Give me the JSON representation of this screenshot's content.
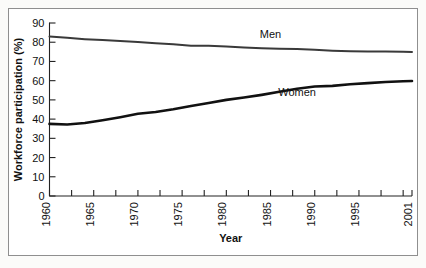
{
  "chart_data": {
    "type": "line",
    "title": "",
    "xlabel": "Year",
    "ylabel": "Workforce participation (%)",
    "xlim": [
      1960,
      2001
    ],
    "ylim": [
      0,
      90
    ],
    "ytick_values": [
      0,
      10,
      20,
      30,
      40,
      50,
      60,
      70,
      80,
      90
    ],
    "ytick_labels": [
      "0",
      "10",
      "20",
      "30",
      "40",
      "50",
      "60",
      "70",
      "80",
      "90"
    ],
    "xtick_labels": [
      "1960",
      "1965",
      "1970",
      "1975",
      "1980",
      "1985",
      "1990",
      "1995",
      "2001"
    ],
    "xtick_label_values": [
      1960,
      1965,
      1970,
      1975,
      1980,
      1985,
      1990,
      1995,
      2001
    ],
    "xtick_minor_values": [
      1962.5,
      1967.5,
      1972.5,
      1977.5,
      1982.5,
      1987.5,
      1992.5,
      1997.5,
      2000
    ],
    "grid": false,
    "legend_position": "inline-annotation",
    "series": [
      {
        "name": "Men",
        "label": "Men",
        "color": "#3a3a3a",
        "stroke_width": 2.0,
        "label_x": 1985,
        "label_y": 82,
        "x": [
          1960,
          1962,
          1964,
          1966,
          1968,
          1970,
          1972,
          1974,
          1976,
          1978,
          1980,
          1982,
          1984,
          1986,
          1988,
          1990,
          1992,
          1994,
          1996,
          1998,
          2000,
          2001
        ],
        "values": [
          83.0,
          82.3,
          81.6,
          81.1,
          80.6,
          80.1,
          79.5,
          79.0,
          78.2,
          78.1,
          77.8,
          77.2,
          76.8,
          76.6,
          76.5,
          76.1,
          75.6,
          75.3,
          75.2,
          75.2,
          75.0,
          74.9
        ]
      },
      {
        "name": "Women",
        "label": "Women",
        "color": "#111111",
        "stroke_width": 2.6,
        "label_x": 1988,
        "label_y": 52,
        "x": [
          1960,
          1962,
          1964,
          1966,
          1968,
          1970,
          1972,
          1974,
          1976,
          1978,
          1980,
          1982,
          1984,
          1986,
          1988,
          1990,
          1992,
          1994,
          1996,
          1998,
          2000,
          2001
        ],
        "values": [
          37.5,
          37.2,
          38.0,
          39.4,
          41.0,
          42.8,
          43.7,
          45.1,
          46.8,
          48.4,
          50.0,
          51.2,
          52.6,
          54.2,
          55.8,
          57.0,
          57.3,
          58.1,
          58.7,
          59.3,
          59.7,
          59.8
        ]
      }
    ]
  },
  "figure": {
    "y_axis_title": "Workforce participation (%)",
    "x_axis_title": "Year"
  }
}
